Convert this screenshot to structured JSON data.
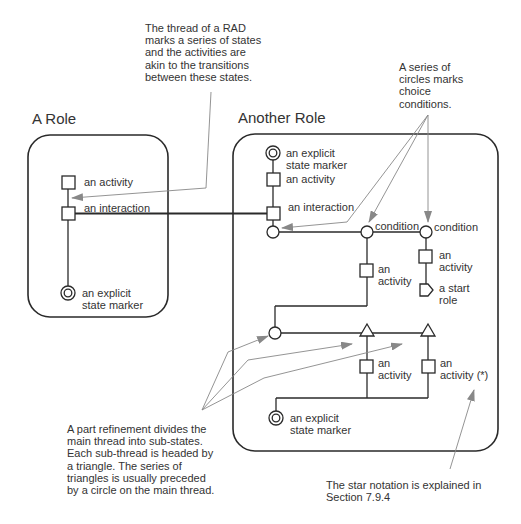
{
  "roles": [
    {
      "title": "A Role",
      "labels": {
        "activity": "an activity",
        "interaction": "an interaction",
        "state_marker": "an explicit\nstate marker"
      }
    },
    {
      "title": "Another Role",
      "labels": {
        "state_marker_top": "an explicit\nstate marker",
        "activity_top": "an activity",
        "interaction": "an interaction",
        "condition_1": "condition",
        "condition_2": "condition",
        "activity_cond1": "an\nactivity",
        "activity_cond2": "an\nactivity",
        "start_role": "a start\nrole",
        "activity_part1": "an\nactivity",
        "activity_part2": "an\nactivity (*)",
        "state_marker_bottom": "an explicit\nstate marker"
      }
    }
  ],
  "annotations": {
    "thread_note": "The thread of a RAD\nmarks a series of states\nand the activities are\nakin to the transitions\nbetween these states.",
    "circles_note": "A series of\ncircles marks\nchoice\nconditions.",
    "part_refinement_note": "A part refinement divides the\nmain thread into sub-states.\nEach sub-thread is headed by\na triangle. The series of\ntriangles is usually preceded\nby a circle on the main thread.",
    "star_note": "The star notation is explained in\nSection 7.9.4"
  },
  "colors": {
    "line": "#2a2a2a",
    "arrow": "#888888"
  }
}
